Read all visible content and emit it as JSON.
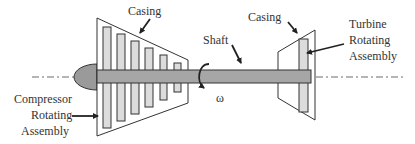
{
  "diagram": {
    "type": "gas-turbine-schematic",
    "labels": {
      "casing_left": "Casing",
      "casing_right": "Casing",
      "shaft": "Shaft",
      "omega": "ω",
      "compressor": [
        "Compressor",
        "Rotating",
        "Assembly"
      ],
      "turbine": [
        "Turbine",
        "Rotating",
        "Assembly"
      ]
    },
    "colors": {
      "outline": "#333333",
      "shaft_fill": "#a6a6a6",
      "nose_fill": "#9a9a9a",
      "blade_fill": "#dcdcdc",
      "background": "#ffffff"
    },
    "compressor_stages": 6
  }
}
